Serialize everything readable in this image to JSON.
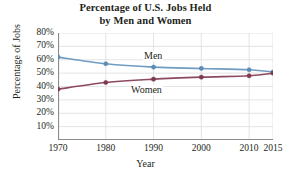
{
  "chart_data": {
    "type": "line",
    "title": "Percentage of U.S. Jobs Held by Men and Women",
    "title_lines": [
      "Percentage of U.S. Jobs Held",
      "by Men and Women"
    ],
    "xlabel": "Year",
    "ylabel": "Percentage of Jobs",
    "x": [
      1970,
      1980,
      1990,
      2000,
      2010,
      2015
    ],
    "xtick_labels": [
      "1970",
      "1980",
      "1990",
      "2000",
      "2010",
      "2015"
    ],
    "xlim": [
      1970,
      2015
    ],
    "ylim": [
      0,
      80
    ],
    "ytick_values": [
      10,
      20,
      30,
      40,
      50,
      60,
      70,
      80
    ],
    "ytick_labels": [
      "10%",
      "20%",
      "30%",
      "40%",
      "50%",
      "60%",
      "70%",
      "80%"
    ],
    "grid": true,
    "legend_position": "inline-on-plot",
    "series": [
      {
        "name": "Men",
        "color": "#6f9cc0",
        "marker_color": "#5b8cb4",
        "values": [
          62,
          57,
          54.5,
          53.5,
          52.5,
          50.8
        ]
      },
      {
        "name": "Women",
        "color": "#8d4a5e",
        "marker_color": "#7d3b50",
        "values": [
          38,
          43,
          45.5,
          47,
          48,
          50
        ]
      }
    ],
    "annotations": [
      {
        "text": "Men",
        "series": "Men"
      },
      {
        "text": "Women",
        "series": "Women"
      }
    ]
  },
  "axis": {
    "line_color": "#8b8b8b",
    "grid_color": "#d9d9d9"
  }
}
